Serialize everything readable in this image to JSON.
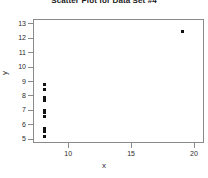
{
  "chart_data": {
    "type": "scatter",
    "title": "Scatter Plot for Data Set #4",
    "xlabel": "x",
    "ylabel": "y",
    "xlim": [
      7.2,
      20.8
    ],
    "ylim": [
      4.7,
      13.3
    ],
    "xticks": [
      10,
      15,
      20
    ],
    "yticks": [
      5,
      6,
      7,
      8,
      9,
      10,
      11,
      12,
      13
    ],
    "grid": false,
    "legend": null,
    "marker": "filled-square",
    "marker_color": "#111111",
    "series": [
      {
        "name": "Data Set #4",
        "points": [
          {
            "x": 8,
            "y": 8.84
          },
          {
            "x": 8,
            "y": 8.47
          },
          {
            "x": 8,
            "y": 7.91
          },
          {
            "x": 8,
            "y": 7.71
          },
          {
            "x": 8,
            "y": 7.04
          },
          {
            "x": 8,
            "y": 6.89
          },
          {
            "x": 8,
            "y": 6.58
          },
          {
            "x": 8,
            "y": 5.76
          },
          {
            "x": 8,
            "y": 5.56
          },
          {
            "x": 8,
            "y": 5.25
          },
          {
            "x": 19,
            "y": 12.5
          }
        ]
      }
    ]
  }
}
